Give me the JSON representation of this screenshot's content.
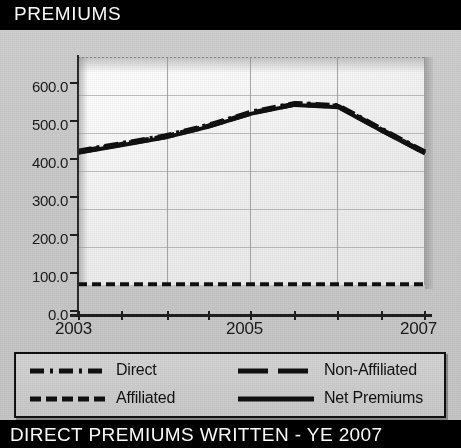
{
  "header": {
    "title": "PREMIUMS"
  },
  "footer": {
    "left_note": "See Sec. 2, B.3",
    "units": "$ Millions",
    "bottom_bar": "DIRECT PREMIUMS WRITTEN - YE 2007"
  },
  "legend": {
    "items": [
      {
        "label": "Direct",
        "style": "dash-dot"
      },
      {
        "label": "Non-Affiliated",
        "style": "long-dash"
      },
      {
        "label": "Affiliated",
        "style": "dashed"
      },
      {
        "label": "Net Premiums",
        "style": "solid"
      }
    ]
  },
  "chart_data": {
    "type": "line",
    "title": "PREMIUMS",
    "xlabel": "",
    "ylabel": "",
    "units": "$ Millions",
    "grid": true,
    "legend_position": "bottom",
    "ylim": [
      0.0,
      600.0
    ],
    "ytick_labels": [
      "600.0",
      "500.0",
      "400.0",
      "300.0",
      "200.0",
      "100.0",
      "0.0"
    ],
    "yticks": [
      600.0,
      500.0,
      400.0,
      300.0,
      200.0,
      100.0,
      0.0
    ],
    "xtick_labels": [
      "2003",
      "2005",
      "2007"
    ],
    "xticks": [
      2003,
      2005,
      2007
    ],
    "xlim": [
      2003,
      2007
    ],
    "x": [
      2003,
      2003.5,
      2004,
      2004.5,
      2005,
      2005.5,
      2006,
      2006.5,
      2007
    ],
    "series": [
      {
        "name": "Direct",
        "values": [
          352,
          372,
          392,
          420,
          455,
          478,
          472,
          410,
          350
        ]
      },
      {
        "name": "Non-Affiliated",
        "values": [
          350,
          370,
          390,
          418,
          453,
          476,
          470,
          408,
          348
        ]
      },
      {
        "name": "Affiliated",
        "values": [
          2,
          2,
          2,
          2,
          2,
          2,
          2,
          2,
          2
        ]
      },
      {
        "name": "Net Premiums",
        "values": [
          348,
          368,
          388,
          416,
          451,
          474,
          468,
          406,
          346
        ]
      }
    ]
  }
}
